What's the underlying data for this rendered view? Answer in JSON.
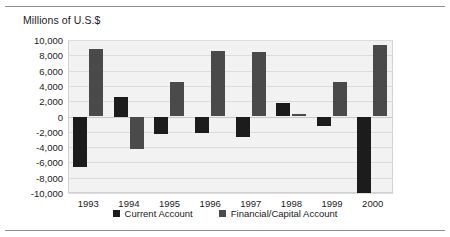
{
  "figure": {
    "axis_title": "Millions of U.S.$"
  },
  "legend": {
    "items": [
      {
        "label": "Current Account",
        "color": "#1c1c1c",
        "swatch_name": "legend-swatch-current-account"
      },
      {
        "label": "Financial/Capital Account",
        "color": "#4a4a4a",
        "swatch_name": "legend-swatch-financial-capital-account"
      }
    ]
  },
  "chart_data": {
    "type": "bar",
    "title": "",
    "subtitle": "",
    "xlabel": "",
    "ylabel": "Millions of U.S.$",
    "ylim": [
      -10000,
      10000
    ],
    "yticks": [
      10000,
      8000,
      6000,
      4000,
      2000,
      0,
      -2000,
      -4000,
      -6000,
      -8000,
      -10000
    ],
    "ytick_labels": [
      "10,000",
      "8,000",
      "6,000",
      "4,000",
      "2,000",
      "0",
      "-2,000",
      "-4,000",
      "-6,000",
      "-8,000",
      "-10,000"
    ],
    "categories": [
      "1993",
      "1994",
      "1995",
      "1996",
      "1997",
      "1998",
      "1999",
      "2000"
    ],
    "grid": true,
    "legend_position": "bottom",
    "series": [
      {
        "name": "Current Account",
        "color": "#1c1c1c",
        "values": [
          -6600,
          2500,
          -2300,
          -2200,
          -2700,
          1800,
          -1300,
          -10000
        ]
      },
      {
        "name": "Financial/Capital Account",
        "color": "#4a4a4a",
        "values": [
          8800,
          -4300,
          4500,
          8500,
          8400,
          300,
          4500,
          9300
        ]
      }
    ]
  }
}
